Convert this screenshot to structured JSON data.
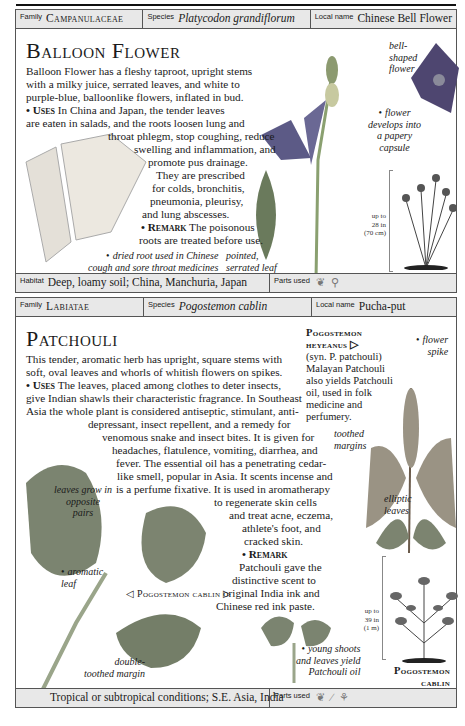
{
  "panels": [
    {
      "header": {
        "family_label": "Family",
        "family": "Campanulaceae",
        "species_label": "Species",
        "species": "Platycodon grandiflorum",
        "local_label": "Local name",
        "local": "Chinese Bell Flower"
      },
      "title": "Balloon Flower",
      "body_lines": [
        "Balloon Flower has a fleshy taproot, upright stems",
        "with a milky juice, serrated leaves, and white to",
        "purple-blue, balloonlike flowers, inflated in bud."
      ],
      "uses_label": "Uses",
      "uses_lines": [
        "In China and Japan, the tender leaves",
        "are eaten in salads, and the roots loosen lung and",
        "throat phlegm, stop coughing, reduce",
        "swelling and inflammation, and",
        "promote pus drainage.",
        "They are prescribed",
        "for colds, bronchitis,",
        "pneumonia, pleurisy,",
        "and lung abscesses."
      ],
      "remark_label": "Remark",
      "remark_lines": [
        "The poisonous",
        "roots are treated before use."
      ],
      "captions": {
        "bell_shaped": [
          "bell-",
          "shaped",
          "flower"
        ],
        "capsule": [
          "flower",
          "develops into",
          "a papery",
          "capsule"
        ],
        "dried_root": [
          "dried root used in Chinese",
          "cough and sore throat medicines"
        ],
        "pointed_leaf": [
          "pointed,",
          "serrated leaf"
        ]
      },
      "size": [
        "up to",
        "28 in",
        "(70 cm)"
      ],
      "footer": {
        "habitat_label": "Habitat",
        "habitat": "Deep, loamy soil; China, Manchuria, Japan",
        "parts_label": "Parts used",
        "parts_icons": [
          "leaf-icon",
          "root-icon"
        ]
      }
    },
    {
      "header": {
        "family_label": "Family",
        "family": "Labiatae",
        "species_label": "Species",
        "species": "Pogostemon cablin",
        "local_label": "Local name",
        "local": "Pucha-put"
      },
      "title": "Patchouli",
      "body_lines": [
        "This tender, aromatic herb has upright, square stems with",
        "soft, oval leaves and whorls of whitish flowers on spikes."
      ],
      "uses_label": "Uses",
      "uses_lines": [
        "The leaves, placed among clothes to deter insects,",
        "give Indian shawls their characteristic fragrance. In Southeast",
        "Asia the whole plant is considered antiseptic, stimulant, anti-",
        "depressant, insect repellent, and a remedy for",
        "venomous snake and insect bites. It is given for",
        "headaches, flatulence, vomiting, diarrhea, and",
        "fever. The essential oil has a penetrating cedar-",
        "like smell, popular in Asia. It scents incense and",
        "is a perfume fixative. It is used in aromatherapy",
        "to regenerate skin cells",
        "and treat acne, eczema,",
        "athlete's foot, and",
        "cracked skin."
      ],
      "remark_label": "Remark",
      "remark_lines": [
        "Patchouli gave the",
        "distinctive scent to",
        "original India ink and",
        "Chinese red ink paste."
      ],
      "side_note": {
        "title_1": "Pogostemon",
        "title_2": "heyeanus ▷",
        "lines": [
          "(syn. P. patchouli)",
          "Malayan Patchouli",
          "also yields Patchouli",
          "oil, used in folk",
          "medicine and",
          "perfumery."
        ]
      },
      "captions": {
        "flower_spike": [
          "flower",
          "spike"
        ],
        "toothed_margins": [
          "toothed",
          "margins"
        ],
        "elliptic_leaves": [
          "elliptic",
          "leaves"
        ],
        "opposite_pairs": [
          "leaves grow in",
          "opposite",
          "pairs"
        ],
        "aromatic_leaf": [
          "aromatic",
          "leaf"
        ],
        "cablin_label": "◁ Pogostemon cablin ▷",
        "double_toothed": [
          "double-",
          "toothed margin"
        ],
        "young_shoots": [
          "young shoots",
          "and leaves yield",
          "Patchouli oil"
        ],
        "illus_label": [
          "Pogostemon",
          "cablin"
        ]
      },
      "size": [
        "up to",
        "39 in",
        "(1 m)"
      ],
      "footer": {
        "habitat": "Tropical or subtropical conditions; S.E. Asia, India",
        "parts_label": "Parts used",
        "parts_icons": [
          "leaf-icon",
          "stem-icon",
          "flower-icon"
        ]
      }
    }
  ]
}
